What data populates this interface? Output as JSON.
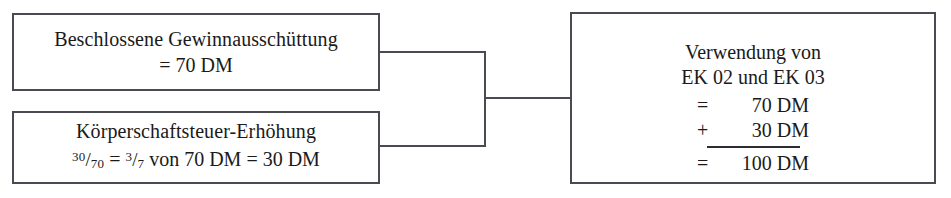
{
  "diagram": {
    "currency": "DM",
    "line_color": "#4a4a52",
    "background_color": "#ffffff",
    "text_color": "#1a1a1a"
  },
  "boxes": {
    "payout": {
      "name": "Beschlossene Gewinnausschüttung",
      "line1": "Beschlossene Gewinnausschüttung",
      "line2": "= 70 DM",
      "amount": 70
    },
    "tax": {
      "name": "Körperschaftsteuer-Erhöhung",
      "line1": "Körperschaftsteuer-Erhöhung",
      "fraction1_num": "30",
      "fraction1_den": "70",
      "equals1": "=",
      "fraction2_num": "3",
      "fraction2_den": "7",
      "von": "von",
      "base": "70 DM",
      "equals2": "=",
      "result": "30 DM",
      "amount": 30
    },
    "usage": {
      "head_line1": "Verwendung von",
      "head_line2": "EK 02 und EK 03",
      "rows": [
        {
          "op": "=",
          "value": "70 DM"
        },
        {
          "op": "+",
          "value": "30 DM"
        }
      ],
      "total_op": "=",
      "total_value": "100 DM",
      "total_amount": 100
    }
  },
  "connectors": {
    "top_label": "Gewinnausschüttung zur Verwendung",
    "bottom_label": "Körperschaftsteuer-Erhöhung zur Verwendung",
    "merge_label": "Summe"
  }
}
